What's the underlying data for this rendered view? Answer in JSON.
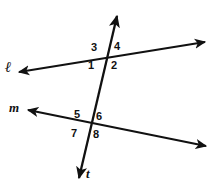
{
  "figure": {
    "kind": "geometry-diagram",
    "background_color": "#ffffff",
    "stroke_color": "#111111",
    "width": 213,
    "height": 191
  },
  "lines": [
    {
      "id": "line-l",
      "label": "ℓ",
      "arrowheads": "both",
      "start": {
        "x": 19,
        "y": 72
      },
      "end": {
        "x": 205,
        "y": 42
      }
    },
    {
      "id": "line-m",
      "label": "m",
      "arrowheads": "both",
      "start": {
        "x": 28,
        "y": 110
      },
      "end": {
        "x": 206,
        "y": 146
      }
    },
    {
      "id": "line-t",
      "label": "t",
      "arrowheads": "both",
      "start": {
        "x": 117,
        "y": 16
      },
      "end": {
        "x": 79,
        "y": 178
      }
    }
  ],
  "intersections": [
    {
      "id": "intersection-upper",
      "x": 106,
      "y": 59,
      "lines": [
        "line-l",
        "line-t"
      ]
    },
    {
      "id": "intersection-lower",
      "x": 90,
      "y": 127,
      "lines": [
        "line-m",
        "line-t"
      ]
    }
  ],
  "angle_labels": [
    {
      "id": "angle-1",
      "text": "1"
    },
    {
      "id": "angle-2",
      "text": "2"
    },
    {
      "id": "angle-3",
      "text": "3"
    },
    {
      "id": "angle-4",
      "text": "4"
    },
    {
      "id": "angle-5",
      "text": "5"
    },
    {
      "id": "angle-6",
      "text": "6"
    },
    {
      "id": "angle-7",
      "text": "7"
    },
    {
      "id": "angle-8",
      "text": "8"
    }
  ]
}
